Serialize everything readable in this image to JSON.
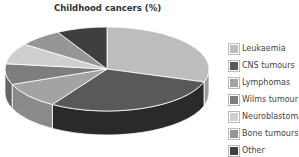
{
  "chart_data": {
    "type": "pie",
    "title": "Childhood cancers (%)",
    "categories": [
      "Leukaemia",
      "CNS tumours",
      "Lymphomas",
      "Wilms tumour",
      "Neuroblastoma",
      "Bone tumours",
      "Other"
    ],
    "values": [
      30,
      29,
      10,
      8,
      8,
      7,
      8
    ],
    "colors": [
      "#bdbdbd",
      "#595959",
      "#a3a3a3",
      "#7d7d7d",
      "#cfcfcf",
      "#969696",
      "#3f3f3f"
    ],
    "side_colors": [
      "#9c9c9c",
      "#2a2a2a",
      "#8a8a8a",
      "#646464",
      "#b0b0b0",
      "#7e7e7e",
      "#222222"
    ],
    "legend_position": "right",
    "style": "3d-tilted"
  }
}
